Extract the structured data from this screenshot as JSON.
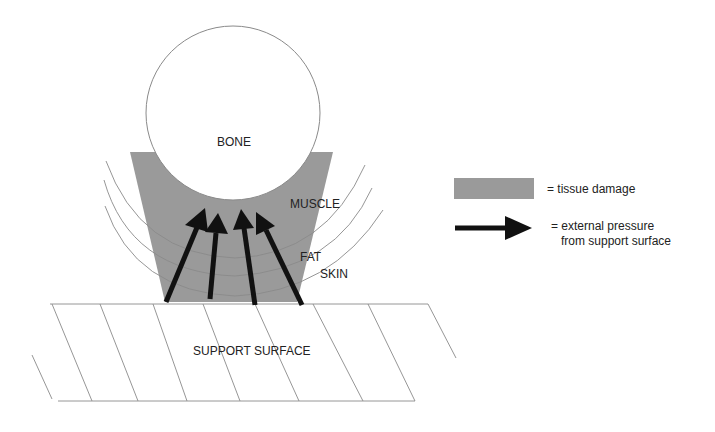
{
  "diagram": {
    "labels": {
      "bone": "BONE",
      "muscle": "MUSCLE",
      "fat": "FAT",
      "skin": "SKIN",
      "support_surface": "SUPPORT SURFACE"
    },
    "legend": {
      "tissue_damage": "= tissue damage",
      "pressure_line1": "= external pressure",
      "pressure_line2": "from support surface"
    },
    "colors": {
      "tissue_damage": "#9a9a9a",
      "arrow": "#111111",
      "lines": "#9a9a9a"
    }
  }
}
